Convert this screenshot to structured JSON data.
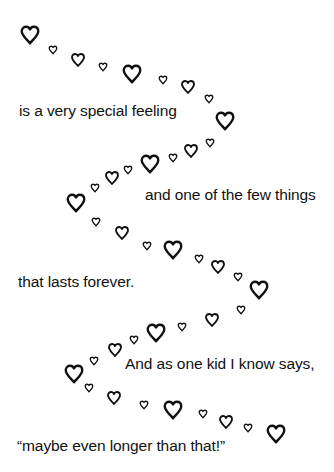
{
  "poem": {
    "lines": [
      {
        "text": "is a very special feeling",
        "x": 19,
        "y": 111
      },
      {
        "text": "and one of the few things",
        "x": 145,
        "y": 195
      },
      {
        "text": "that lasts forever.",
        "x": 18,
        "y": 282
      },
      {
        "text": "And as one kid I know says,",
        "x": 125,
        "y": 364
      },
      {
        "text": "“maybe even longer than that!”",
        "x": 17,
        "y": 446
      }
    ]
  },
  "hearts": {
    "icon": "heart-outline-icon",
    "color": "#111111",
    "sizes": {
      "L": 22,
      "M": 16,
      "S": 10
    },
    "items": [
      [
        30,
        35,
        "L"
      ],
      [
        53,
        50,
        "S"
      ],
      [
        78,
        60,
        "M"
      ],
      [
        103,
        67,
        "S"
      ],
      [
        132,
        74,
        "L"
      ],
      [
        163,
        80,
        "S"
      ],
      [
        188,
        87,
        "M"
      ],
      [
        209,
        99,
        "S"
      ],
      [
        225,
        121,
        "L"
      ],
      [
        210,
        143,
        "S"
      ],
      [
        191,
        151,
        "M"
      ],
      [
        173,
        158,
        "S"
      ],
      [
        150,
        164,
        "L"
      ],
      [
        128,
        170,
        "S"
      ],
      [
        112,
        178,
        "M"
      ],
      [
        95,
        188,
        "S"
      ],
      [
        76,
        203,
        "L"
      ],
      [
        96,
        222,
        "S"
      ],
      [
        122,
        233,
        "M"
      ],
      [
        147,
        246,
        "S"
      ],
      [
        173,
        250,
        "L"
      ],
      [
        199,
        259,
        "S"
      ],
      [
        218,
        267,
        "M"
      ],
      [
        238,
        277,
        "S"
      ],
      [
        259,
        290,
        "L"
      ],
      [
        241,
        310,
        "S"
      ],
      [
        212,
        320,
        "M"
      ],
      [
        182,
        327,
        "S"
      ],
      [
        156,
        333,
        "L"
      ],
      [
        134,
        340,
        "S"
      ],
      [
        115,
        350,
        "M"
      ],
      [
        94,
        361,
        "S"
      ],
      [
        74,
        374,
        "L"
      ],
      [
        89,
        388,
        "S"
      ],
      [
        114,
        398,
        "M"
      ],
      [
        144,
        405,
        "S"
      ],
      [
        173,
        410,
        "L"
      ],
      [
        203,
        414,
        "S"
      ],
      [
        226,
        422,
        "M"
      ],
      [
        248,
        428,
        "S"
      ],
      [
        276,
        434,
        "L"
      ]
    ]
  }
}
